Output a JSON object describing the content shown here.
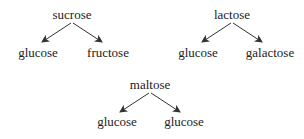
{
  "diagram": {
    "text_color": "#222222",
    "arrow_color": "#333333",
    "groups": [
      {
        "name": "sucrose",
        "parent": "sucrose",
        "children": [
          "glucose",
          "fructose"
        ]
      },
      {
        "name": "lactose",
        "parent": "lactose",
        "children": [
          "glucose",
          "galactose"
        ]
      },
      {
        "name": "maltose",
        "parent": "maltose",
        "children": [
          "glucose",
          "glucose"
        ]
      }
    ]
  }
}
